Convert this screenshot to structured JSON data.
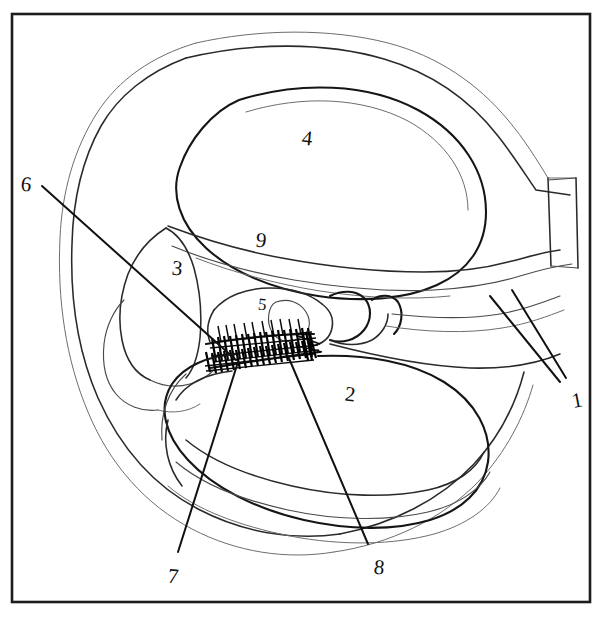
{
  "figure": {
    "kind": "hand-drawn anatomical line diagram",
    "background_color": "#ffffff",
    "ink_color": "#1a1a1a",
    "frame": {
      "present": true,
      "color": "#1c1c1c",
      "x": 12,
      "y": 14,
      "width": 578,
      "height": 588
    },
    "canvas": {
      "width": 603,
      "height": 617
    }
  },
  "labels": [
    {
      "id": "label-1",
      "text": "1",
      "x": 572,
      "y": 390,
      "tilt": "tilt-l",
      "size": "normal"
    },
    {
      "id": "label-2",
      "text": "2",
      "x": 345,
      "y": 384,
      "tilt": "tilt-r",
      "size": "normal"
    },
    {
      "id": "label-3",
      "text": "3",
      "x": 172,
      "y": 258,
      "tilt": "tilt-r",
      "size": "normal"
    },
    {
      "id": "label-4",
      "text": "4",
      "x": 302,
      "y": 128,
      "tilt": "tilt-r",
      "size": "normal"
    },
    {
      "id": "label-5",
      "text": "5",
      "x": 258,
      "y": 296,
      "tilt": "tilt-r",
      "size": "small"
    },
    {
      "id": "label-6",
      "text": "6",
      "x": 21,
      "y": 174,
      "tilt": "tilt-r",
      "size": "normal"
    },
    {
      "id": "label-7",
      "text": "7",
      "x": 168,
      "y": 566,
      "tilt": "tilt-r",
      "size": "normal"
    },
    {
      "id": "label-8",
      "text": "8",
      "x": 374,
      "y": 557,
      "tilt": "tilt-r",
      "size": "normal"
    },
    {
      "id": "label-9",
      "text": "9",
      "x": 256,
      "y": 230,
      "tilt": "tilt-r",
      "size": "normal"
    }
  ],
  "leader_lines": [
    {
      "id": "leader-1",
      "from_label": "1",
      "description": "from label 1 up-left crossing the outer duct wall"
    },
    {
      "id": "leader-6",
      "from_label": "6",
      "description": "long diagonal from label 6 down-right into the hatched organ region"
    },
    {
      "id": "leader-7",
      "from_label": "7",
      "description": "from label 7 up-right to the hatched organ region"
    },
    {
      "id": "leader-8",
      "from_label": "8",
      "description": "from label 8 up-left to the hatched organ region"
    }
  ],
  "regions": [
    {
      "id": "region-outer-capsule",
      "name": "outer capsule outline"
    },
    {
      "id": "region-upper-chamber",
      "name": "upper scala chamber (4)"
    },
    {
      "id": "region-lower-chamber",
      "name": "lower scala chamber (2)"
    },
    {
      "id": "region-left-lobe",
      "name": "left lobe structure (3)"
    },
    {
      "id": "region-membrane",
      "name": "dividing membrane (9)"
    },
    {
      "id": "region-hatched-organ",
      "name": "cross-hatched sensory organ (5)"
    },
    {
      "id": "region-right-strip",
      "name": "vertical strip at right edge"
    }
  ]
}
